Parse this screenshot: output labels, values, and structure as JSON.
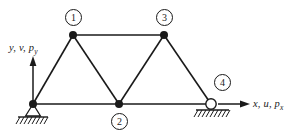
{
  "diagram": {
    "type": "structural-truss",
    "colors": {
      "line": "#1a1a1a",
      "node_fill": "#1a1a1a",
      "roller_fill": "#ffffff",
      "background": "#ffffff"
    },
    "axes": {
      "y_label_text": "y, v, p",
      "y_label_sub": "y",
      "x_label_text": "x, u, p",
      "x_label_sub": "x"
    },
    "nodes": [
      {
        "id": "1",
        "label": "1",
        "x": 73,
        "y": 35,
        "style": "filled",
        "tag_x": 65,
        "tag_y": 9
      },
      {
        "id": "2",
        "label": "2",
        "x": 119,
        "y": 104,
        "style": "filled",
        "tag_x": 111,
        "tag_y": 113
      },
      {
        "id": "3",
        "label": "3",
        "x": 164,
        "y": 35,
        "style": "filled",
        "tag_x": 156,
        "tag_y": 9
      },
      {
        "id": "4",
        "label": "4",
        "x": 211,
        "y": 104,
        "style": "roller",
        "tag_x": 214,
        "tag_y": 74
      }
    ],
    "members": [
      {
        "from": "support-left",
        "to": "1"
      },
      {
        "from": "1",
        "to": "3"
      },
      {
        "from": "1",
        "to": "2"
      },
      {
        "from": "2",
        "to": "3"
      },
      {
        "from": "3",
        "to": "4"
      },
      {
        "from": "support-left",
        "to": "4"
      }
    ],
    "supports": [
      {
        "kind": "pinned",
        "at_node": "left-base",
        "x": 33,
        "y": 104
      },
      {
        "kind": "roller",
        "at_node": "4",
        "x": 211,
        "y": 104
      }
    ]
  }
}
